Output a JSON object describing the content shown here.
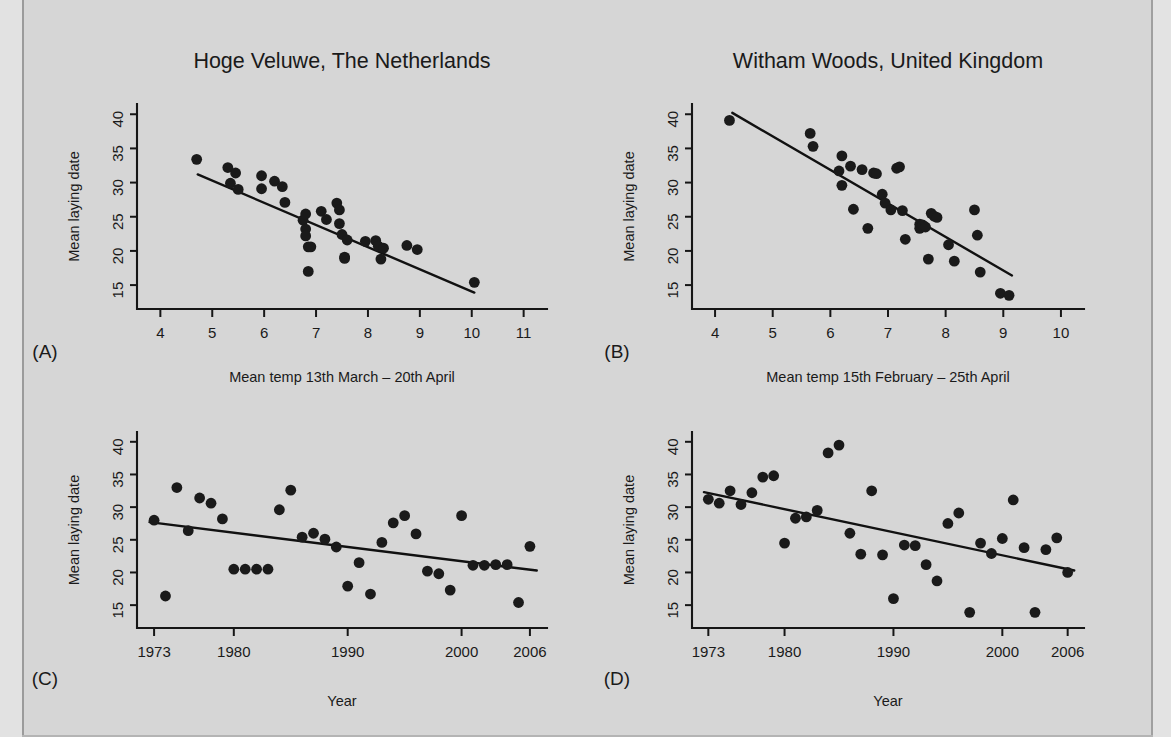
{
  "figure": {
    "background_color": "#d6d6d6",
    "ink_color": "#1a1a1a",
    "panel_letters": [
      "(A)",
      "(B)",
      "(C)",
      "(D)"
    ]
  },
  "chart_data": [
    {
      "id": "panel-a",
      "letter": "(A)",
      "type": "scatter",
      "title": "Hoge Veluwe, The Netherlands",
      "xlabel": "Mean temp 13th March – 20th April",
      "ylabel": "Mean laying date",
      "xlim": [
        3.55,
        11.45
      ],
      "ylim": [
        11.5,
        41.5
      ],
      "xticks": [
        4,
        5,
        6,
        7,
        8,
        9,
        10,
        11
      ],
      "yticks": [
        15,
        20,
        25,
        30,
        35,
        40
      ],
      "grid": false,
      "legend": "none",
      "x": [
        4.7,
        5.3,
        5.45,
        5.35,
        5.5,
        5.95,
        5.95,
        6.2,
        6.35,
        6.4,
        6.75,
        6.8,
        6.8,
        6.8,
        6.85,
        6.85,
        6.9,
        7.1,
        7.2,
        7.4,
        7.45,
        7.45,
        7.5,
        7.55,
        7.55,
        7.6,
        7.95,
        8.15,
        8.2,
        8.25,
        8.3,
        8.75,
        8.95,
        10.05
      ],
      "y": [
        33.4,
        32.2,
        31.4,
        29.9,
        29.0,
        31.0,
        29.1,
        30.2,
        29.4,
        27.1,
        24.5,
        25.4,
        23.2,
        22.2,
        20.6,
        17.0,
        20.6,
        25.8,
        24.6,
        27.0,
        26.0,
        24.0,
        22.4,
        19.1,
        18.9,
        21.6,
        21.4,
        21.5,
        20.7,
        18.8,
        20.4,
        20.8,
        20.2,
        15.4
      ],
      "fit_line": {
        "x0": 4.72,
        "y0": 31.2,
        "x1": 10.05,
        "y1": 13.9
      }
    },
    {
      "id": "panel-b",
      "letter": "(B)",
      "type": "scatter",
      "title": "Witham Woods, United Kingdom",
      "xlabel": "Mean temp 15th February – 25th April",
      "ylabel": "Mean laying date",
      "xlim": [
        3.6,
        10.4
      ],
      "ylim": [
        11.5,
        41.5
      ],
      "xticks": [
        4,
        5,
        6,
        7,
        8,
        9,
        10
      ],
      "yticks": [
        15,
        20,
        25,
        30,
        35,
        40
      ],
      "grid": false,
      "legend": "none",
      "x": [
        4.25,
        5.65,
        5.7,
        6.15,
        6.2,
        6.2,
        6.35,
        6.4,
        6.55,
        6.65,
        6.75,
        6.8,
        6.9,
        6.95,
        7.05,
        7.15,
        7.2,
        7.25,
        7.3,
        7.55,
        7.55,
        7.6,
        7.65,
        7.7,
        7.75,
        7.8,
        7.85,
        8.05,
        8.15,
        8.5,
        8.55,
        8.6,
        8.95,
        9.1
      ],
      "y": [
        39.1,
        37.2,
        35.3,
        31.7,
        33.9,
        29.6,
        32.4,
        26.1,
        31.9,
        23.3,
        31.4,
        31.3,
        28.3,
        27.0,
        26.0,
        32.1,
        32.3,
        25.9,
        21.7,
        23.9,
        23.3,
        23.8,
        23.5,
        18.8,
        25.5,
        25.1,
        24.9,
        20.9,
        18.5,
        26.0,
        22.3,
        16.9,
        13.8,
        13.5
      ],
      "fit_line": {
        "x0": 4.3,
        "y0": 40.2,
        "x1": 9.15,
        "y1": 16.4
      }
    },
    {
      "id": "panel-c",
      "letter": "(C)",
      "type": "scatter",
      "title": "",
      "xlabel": "Year",
      "ylabel": "Mean laying date",
      "xlim": [
        1971.5,
        2007.5
      ],
      "ylim": [
        11.5,
        41.5
      ],
      "xticks": [
        1973,
        1980,
        1990,
        2000,
        2006
      ],
      "yticks": [
        15,
        20,
        25,
        30,
        35,
        40
      ],
      "grid": false,
      "legend": "none",
      "x": [
        1973,
        1974,
        1975,
        1976,
        1977,
        1978,
        1979,
        1980,
        1981,
        1982,
        1983,
        1984,
        1985,
        1986,
        1987,
        1988,
        1989,
        1990,
        1991,
        1992,
        1993,
        1994,
        1995,
        1996,
        1997,
        1998,
        1999,
        2000,
        2001,
        2002,
        2003,
        2004,
        2005,
        2006
      ],
      "y": [
        28.0,
        16.4,
        33.0,
        26.4,
        31.4,
        30.6,
        28.2,
        20.5,
        20.5,
        20.5,
        20.5,
        29.6,
        32.6,
        25.4,
        26.0,
        25.1,
        23.9,
        17.9,
        21.5,
        16.7,
        24.6,
        27.6,
        28.7,
        25.9,
        20.2,
        19.8,
        17.3,
        28.7,
        21.1,
        21.1,
        21.2,
        21.2,
        15.4,
        24.0
      ],
      "fit_line": {
        "x0": 1972.6,
        "y0": 27.7,
        "x1": 2006.6,
        "y1": 20.3
      }
    },
    {
      "id": "panel-d",
      "letter": "(D)",
      "type": "scatter",
      "title": "",
      "xlabel": "Year",
      "ylabel": "Mean laying date",
      "xlim": [
        1971.5,
        2007.5
      ],
      "ylim": [
        11.5,
        41.5
      ],
      "xticks": [
        1973,
        1980,
        1990,
        2000,
        2006
      ],
      "yticks": [
        15,
        20,
        25,
        30,
        35,
        40
      ],
      "grid": false,
      "legend": "none",
      "x": [
        1973,
        1974,
        1975,
        1976,
        1977,
        1978,
        1979,
        1980,
        1981,
        1982,
        1983,
        1984,
        1985,
        1986,
        1987,
        1988,
        1989,
        1990,
        1991,
        1992,
        1993,
        1994,
        1995,
        1996,
        1997,
        1998,
        1999,
        2000,
        2001,
        2002,
        2003,
        2004,
        2005,
        2006
      ],
      "y": [
        31.2,
        30.6,
        32.5,
        30.4,
        32.2,
        34.6,
        34.8,
        24.5,
        28.3,
        28.5,
        29.5,
        38.3,
        39.5,
        26.0,
        22.8,
        32.5,
        22.7,
        16.0,
        24.2,
        24.1,
        21.2,
        18.7,
        27.5,
        29.1,
        13.9,
        24.5,
        22.9,
        25.2,
        31.1,
        23.8,
        13.9,
        23.5,
        25.3,
        20.0
      ],
      "fit_line": {
        "x0": 1972.6,
        "y0": 32.3,
        "x1": 2006.6,
        "y1": 20.3
      }
    }
  ]
}
